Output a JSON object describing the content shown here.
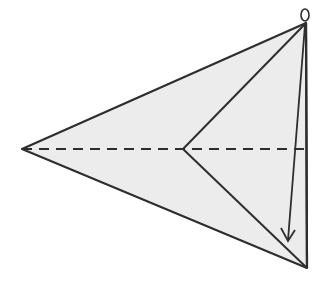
{
  "diagram": {
    "type": "paper-folding-step",
    "colors": {
      "paper_fill": "#ececec",
      "stroke": "#2e2e2e",
      "background": "#ffffff"
    },
    "points": {
      "left_tip": [
        22,
        149
      ],
      "top_apex": [
        306,
        23
      ],
      "bottom_apex": [
        306,
        268
      ],
      "inner_vertex": [
        183,
        149
      ],
      "right_edge_mid": [
        307,
        149
      ],
      "arrow_end": [
        288,
        241
      ],
      "loop_center": [
        305,
        14
      ]
    },
    "elements": [
      {
        "id": "outer-kite",
        "kind": "polygon",
        "style": "solid"
      },
      {
        "id": "right-edge",
        "kind": "line",
        "style": "solid"
      },
      {
        "id": "inner-fold-upper",
        "kind": "line",
        "style": "solid"
      },
      {
        "id": "inner-fold-lower",
        "kind": "line",
        "style": "solid"
      },
      {
        "id": "center-fold",
        "kind": "line",
        "style": "dashed"
      },
      {
        "id": "fold-arrow",
        "kind": "arrow",
        "style": "solid"
      },
      {
        "id": "hook-loop",
        "kind": "ellipse",
        "style": "solid"
      }
    ]
  }
}
